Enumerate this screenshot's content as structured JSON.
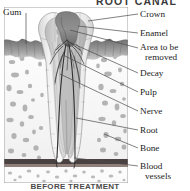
{
  "figure": {
    "kind": "anatomical-illustration",
    "title": "ROOT CANAL",
    "caption": "BEFORE TREATMENT",
    "background": "#ffffff",
    "ink": "#1c1c1c"
  },
  "labels": {
    "gum": "Gum",
    "crown": "Crown",
    "enamel": "Enamel",
    "area_line1": "Area to be",
    "area_line2": "removed",
    "decay": "Decay",
    "pulp": "Pulp",
    "nerve": "Nerve",
    "root": "Root",
    "bone": "Bone",
    "blood_line1": "Blood",
    "blood_line2": "vessels"
  },
  "colors": {
    "enamel": "#e9e9e9",
    "dentin": "#cdcdcd",
    "pulp": "#9a9a9a",
    "decay": "#6f6f6f",
    "gum": "#8c8c8c",
    "bone": "#efefef",
    "marrow": "#f7f7f7",
    "nerve": "#3a3a3a",
    "leader": "#4a4a4a",
    "outline": "#555555"
  }
}
